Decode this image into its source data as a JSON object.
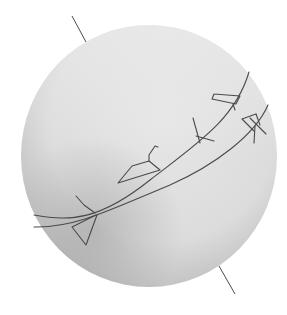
{
  "diagram": {
    "type": "celestial-sphere",
    "colors": {
      "background": "#ffffff",
      "sphere_light": "#e4e4e4",
      "sphere_mid": "#d2d2d2",
      "sphere_shadow": "#a9a9a9",
      "line": "#4a4a4a"
    },
    "sphere": {
      "cx": 149,
      "cy": 156,
      "rx": 128,
      "ry": 131
    },
    "axis": {
      "top": {
        "x1": 72,
        "y1": 16,
        "x2": 86,
        "y2": 42
      },
      "bottom": {
        "x1": 219,
        "y1": 266,
        "x2": 235,
        "y2": 294
      }
    },
    "curves": [
      {
        "name": "ecliptic",
        "d": "M 34 215 C 70 222, 100 220, 150 180 C 195 145, 235 120, 249 72"
      },
      {
        "name": "celestial-equator",
        "d": "M 34 227 C 75 228, 110 210, 170 185 C 215 165, 255 135, 268 105"
      }
    ],
    "constellations": [
      {
        "name": "triangle-glyph",
        "points": "82,198 95,213 97,215 86,245 72,225 97,215"
      },
      {
        "name": "boot-glyph",
        "points": "118,183 133,165 150,163 160,170 150,163 150,155 157,147 155,145 150,163 118,183"
      },
      {
        "name": "cross-glyph-1",
        "lines": [
          [
            193,
            118,
            205,
            140
          ],
          [
            197,
            137,
            214,
            141
          ]
        ]
      },
      {
        "name": "wedge-glyph",
        "points": "212,95 215,103 238,105 242,95 215,97"
      },
      {
        "name": "cross-glyph-2",
        "lines": [
          [
            241,
            115,
            258,
            112
          ],
          [
            248,
            118,
            267,
            135
          ],
          [
            255,
            128,
            256,
            142
          ],
          [
            241,
            115,
            253,
            131
          ]
        ]
      }
    ]
  }
}
